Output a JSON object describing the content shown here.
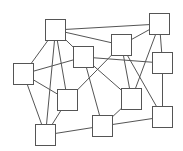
{
  "diagram": {
    "type": "graph",
    "style": {
      "background": "#ffffff",
      "line_color": "#555555",
      "node_fill": "#ffffff",
      "node_size": [
        20,
        21
      ]
    },
    "nodes": [
      {
        "id": "A",
        "x": 45,
        "y": 19
      },
      {
        "id": "B",
        "x": 73,
        "y": 46
      },
      {
        "id": "C",
        "x": 149,
        "y": 13
      },
      {
        "id": "D",
        "x": 111,
        "y": 34
      },
      {
        "id": "E",
        "x": 152,
        "y": 52
      },
      {
        "id": "F",
        "x": 13,
        "y": 63
      },
      {
        "id": "G",
        "x": 57,
        "y": 89
      },
      {
        "id": "H",
        "x": 35,
        "y": 124
      },
      {
        "id": "I",
        "x": 92,
        "y": 115
      },
      {
        "id": "J",
        "x": 121,
        "y": 88
      },
      {
        "id": "K",
        "x": 152,
        "y": 106
      }
    ],
    "edges": [
      [
        "A",
        "C"
      ],
      [
        "A",
        "D"
      ],
      [
        "A",
        "B"
      ],
      [
        "A",
        "F"
      ],
      [
        "A",
        "H"
      ],
      [
        "A",
        "G"
      ],
      [
        "D",
        "C"
      ],
      [
        "D",
        "G"
      ],
      [
        "D",
        "J"
      ],
      [
        "D",
        "K"
      ],
      [
        "B",
        "E"
      ],
      [
        "B",
        "I"
      ],
      [
        "B",
        "J"
      ],
      [
        "F",
        "B"
      ],
      [
        "F",
        "G"
      ],
      [
        "F",
        "H"
      ],
      [
        "G",
        "H"
      ],
      [
        "C",
        "E"
      ],
      [
        "C",
        "J"
      ],
      [
        "E",
        "K"
      ],
      [
        "I",
        "J"
      ],
      [
        "I",
        "K"
      ],
      [
        "H",
        "I"
      ]
    ]
  }
}
